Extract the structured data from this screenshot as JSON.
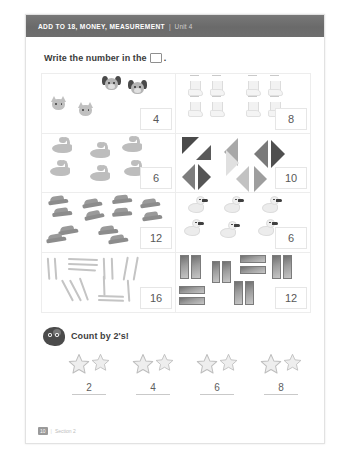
{
  "header": {
    "title": "ADD TO 18, MONEY, MEASUREMENT",
    "separator": "|",
    "unit": "Unit 4"
  },
  "instruction": {
    "text_before": "Write the number in the",
    "box_icon": "empty-square-icon",
    "text_after": "."
  },
  "grid": {
    "cells": [
      {
        "id": "cell-animals",
        "object_type": "cat-and-dog-faces",
        "count": 4,
        "answer": "4",
        "items": [
          {
            "kind": "dog",
            "x": 60,
            "y": 2
          },
          {
            "kind": "dog",
            "x": 86,
            "y": 6
          },
          {
            "kind": "cat",
            "x": 8,
            "y": 22
          },
          {
            "kind": "cat",
            "x": 35,
            "y": 28
          }
        ]
      },
      {
        "id": "cell-boots",
        "object_type": "boots",
        "count": 8,
        "answer": "8",
        "items": [
          {
            "x": 12,
            "y": 1
          },
          {
            "x": 34,
            "y": 1
          },
          {
            "x": 70,
            "y": 1
          },
          {
            "x": 92,
            "y": 1
          },
          {
            "x": 12,
            "y": 22
          },
          {
            "x": 34,
            "y": 22
          },
          {
            "x": 70,
            "y": 22
          },
          {
            "x": 92,
            "y": 22
          }
        ]
      },
      {
        "id": "cell-snakes",
        "object_type": "snakes",
        "count": 6,
        "answer": "6",
        "items": [
          {
            "x": 10,
            "y": 3
          },
          {
            "x": 48,
            "y": 8
          },
          {
            "x": 80,
            "y": 2
          },
          {
            "x": 8,
            "y": 26
          },
          {
            "x": 48,
            "y": 31
          },
          {
            "x": 82,
            "y": 26
          }
        ]
      },
      {
        "id": "cell-triangles",
        "object_type": "triangles",
        "count": 10,
        "answer": "10",
        "items": [
          {
            "x": 6,
            "y": 3,
            "dir": "down-right",
            "shade": "#4a4a4a",
            "size": 17
          },
          {
            "x": 20,
            "y": 11,
            "dir": "up-right",
            "shade": "#5a5a5a",
            "size": 15
          },
          {
            "x": 48,
            "y": 4,
            "dir": "left",
            "shade": "#a8a8a8",
            "size": 14
          },
          {
            "x": 50,
            "y": 16,
            "dir": "right",
            "shade": "#e0e0e0",
            "size": 13
          },
          {
            "x": 78,
            "y": 6,
            "dir": "left",
            "shade": "#7a7a7a",
            "size": 14
          },
          {
            "x": 95,
            "y": 6,
            "dir": "right",
            "shade": "#4f4f4f",
            "size": 14
          },
          {
            "x": 6,
            "y": 30,
            "dir": "left",
            "shade": "#7d7d7d",
            "size": 13
          },
          {
            "x": 22,
            "y": 30,
            "dir": "right",
            "shade": "#555555",
            "size": 13
          },
          {
            "x": 60,
            "y": 32,
            "dir": "left",
            "shade": "#c2c2c2",
            "size": 13
          },
          {
            "x": 78,
            "y": 32,
            "dir": "right",
            "shade": "#9e9e9e",
            "size": 13
          }
        ]
      },
      {
        "id": "cell-shoes",
        "object_type": "shoes",
        "count": 12,
        "answer": "12",
        "items": [
          {
            "x": 6,
            "y": 2,
            "rot": -8
          },
          {
            "x": 40,
            "y": 5,
            "rot": -10
          },
          {
            "x": 70,
            "y": 1,
            "rot": -6
          },
          {
            "x": 98,
            "y": 5,
            "rot": -8
          },
          {
            "x": 10,
            "y": 14,
            "rot": -7
          },
          {
            "x": 42,
            "y": 17,
            "rot": -12
          },
          {
            "x": 70,
            "y": 14,
            "rot": -5
          },
          {
            "x": 100,
            "y": 18,
            "rot": -8
          },
          {
            "x": 16,
            "y": 32,
            "rot": -10
          },
          {
            "x": 4,
            "y": 40,
            "rot": -9
          },
          {
            "x": 56,
            "y": 32,
            "rot": -7
          },
          {
            "x": 66,
            "y": 41,
            "rot": -9
          }
        ]
      },
      {
        "id": "cell-ducks",
        "object_type": "ducks",
        "count": 6,
        "answer": "6",
        "items": [
          {
            "x": 12,
            "y": 3
          },
          {
            "x": 48,
            "y": 3
          },
          {
            "x": 86,
            "y": 3
          },
          {
            "x": 8,
            "y": 26
          },
          {
            "x": 44,
            "y": 28
          },
          {
            "x": 82,
            "y": 26
          }
        ]
      },
      {
        "id": "cell-sticks",
        "object_type": "sticks",
        "count": 16,
        "answer": "16",
        "items": [
          {
            "x": 6,
            "y": 4,
            "len": 22,
            "rot": 86
          },
          {
            "x": 13,
            "y": 4,
            "len": 22,
            "rot": 86
          },
          {
            "x": 26,
            "y": 5,
            "len": 30,
            "rot": 2
          },
          {
            "x": 26,
            "y": 10,
            "len": 30,
            "rot": 2
          },
          {
            "x": 26,
            "y": 15,
            "len": 28,
            "rot": 3
          },
          {
            "x": 20,
            "y": 26,
            "len": 24,
            "rot": 62
          },
          {
            "x": 28,
            "y": 26,
            "len": 24,
            "rot": 62
          },
          {
            "x": 38,
            "y": 24,
            "len": 24,
            "rot": 70
          },
          {
            "x": 62,
            "y": 4,
            "len": 22,
            "rot": 88
          },
          {
            "x": 70,
            "y": 4,
            "len": 22,
            "rot": 88
          },
          {
            "x": 62,
            "y": 22,
            "len": 20,
            "rot": 88
          },
          {
            "x": 86,
            "y": 3,
            "len": 24,
            "rot": 100
          },
          {
            "x": 96,
            "y": 3,
            "len": 24,
            "rot": 100
          },
          {
            "x": 56,
            "y": 42,
            "len": 26,
            "rot": 2
          },
          {
            "x": 56,
            "y": 46,
            "len": 26,
            "rot": 2
          },
          {
            "x": 86,
            "y": 26,
            "len": 22,
            "rot": 86
          }
        ]
      },
      {
        "id": "cell-bars",
        "object_type": "rectangles",
        "count": 12,
        "answer": "12",
        "items": [
          {
            "x": 4,
            "y": 2,
            "w": 9,
            "h": 24
          },
          {
            "x": 15,
            "y": 2,
            "w": 10,
            "h": 24
          },
          {
            "x": 36,
            "y": 8,
            "w": 8,
            "h": 22
          },
          {
            "x": 46,
            "y": 8,
            "w": 9,
            "h": 22
          },
          {
            "x": 64,
            "y": 2,
            "w": 26,
            "h": 8
          },
          {
            "x": 64,
            "y": 13,
            "w": 26,
            "h": 8
          },
          {
            "x": 96,
            "y": 2,
            "w": 9,
            "h": 24
          },
          {
            "x": 107,
            "y": 2,
            "w": 9,
            "h": 24
          },
          {
            "x": 3,
            "y": 33,
            "w": 26,
            "h": 8
          },
          {
            "x": 3,
            "y": 44,
            "w": 26,
            "h": 8
          },
          {
            "x": 58,
            "y": 28,
            "w": 9,
            "h": 24
          },
          {
            "x": 69,
            "y": 28,
            "w": 9,
            "h": 24
          }
        ]
      }
    ]
  },
  "count_section": {
    "mascot_icon": "mascot-character-icon",
    "label": "Count by 2's!",
    "groups": [
      {
        "stars": 2,
        "answer": "2"
      },
      {
        "stars": 2,
        "answer": "4"
      },
      {
        "stars": 2,
        "answer": "6"
      },
      {
        "stars": 2,
        "answer": "8"
      }
    ]
  },
  "footer": {
    "page": "10",
    "separator": "|",
    "section": "Section 2"
  }
}
